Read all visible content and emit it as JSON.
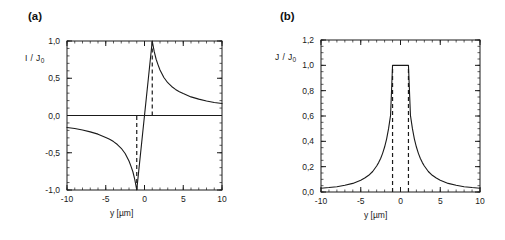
{
  "figure": {
    "width": 505,
    "height": 240,
    "background": "#ffffff",
    "line_color": "#1a1a1a"
  },
  "panels": [
    {
      "label": "(a)",
      "name": "panel-a",
      "ylabel_main": "I / J",
      "ylabel_sub": "0",
      "xlabel": "y [µm]"
    },
    {
      "label": "(b)",
      "name": "panel-b",
      "ylabel_main": "J / J",
      "ylabel_sub": "0",
      "xlabel": "y [µm]"
    }
  ],
  "chart_data": [
    {
      "type": "line",
      "panel": "(a)",
      "title": "",
      "xlabel": "y [µm]",
      "ylabel": "I / J0",
      "xlim": [
        -10,
        10
      ],
      "ylim": [
        -1.0,
        1.0
      ],
      "xticks": [
        -10,
        -5,
        0,
        5,
        10
      ],
      "xticklabels": [
        "-10",
        "-5",
        "0",
        "5",
        "10"
      ],
      "yticks": [
        -1.0,
        -0.5,
        0.0,
        0.5,
        1.0
      ],
      "yticklabels": [
        "-1,0",
        "-0,5",
        "0,0",
        "0,5",
        "1,0"
      ],
      "minor_tick_step_x": 1,
      "minor_tick_step_y": 0.1,
      "grid": false,
      "legend": null,
      "annotations": [
        {
          "type": "vline",
          "x": -1,
          "style": "dashed",
          "y_from": -1.0,
          "y_to": 0.0
        },
        {
          "type": "vline",
          "x": 1,
          "style": "dashed",
          "y_from": 0.0,
          "y_to": 1.0
        },
        {
          "type": "hline",
          "y": 0.0,
          "style": "solid"
        }
      ],
      "series": [
        {
          "name": "I/J0",
          "description": "antisymmetric response; linear ramp from -1 to +1 across |y|<1, then 1/y decay",
          "x": [
            -10,
            -9,
            -8,
            -7,
            -6,
            -5,
            -4.5,
            -4,
            -3.5,
            -3,
            -2.5,
            -2,
            -1.75,
            -1.5,
            -1.25,
            -1.0,
            -0.75,
            -0.5,
            -0.25,
            0,
            0.25,
            0.5,
            0.75,
            1.0,
            1.25,
            1.5,
            1.75,
            2,
            2.5,
            3,
            3.5,
            4,
            4.5,
            5,
            6,
            7,
            8,
            9,
            10
          ],
          "values": [
            -0.16,
            -0.175,
            -0.195,
            -0.22,
            -0.25,
            -0.295,
            -0.32,
            -0.35,
            -0.39,
            -0.44,
            -0.51,
            -0.61,
            -0.68,
            -0.755,
            -0.86,
            -1.0,
            -0.75,
            -0.5,
            -0.25,
            0.0,
            0.25,
            0.5,
            0.75,
            1.0,
            0.86,
            0.755,
            0.68,
            0.61,
            0.51,
            0.44,
            0.39,
            0.35,
            0.32,
            0.295,
            0.25,
            0.22,
            0.195,
            0.175,
            0.16
          ]
        }
      ]
    },
    {
      "type": "line",
      "panel": "(b)",
      "title": "",
      "xlabel": "y [µm]",
      "ylabel": "J / J0",
      "xlim": [
        -10,
        10
      ],
      "ylim": [
        0.0,
        1.2
      ],
      "xticks": [
        -10,
        -5,
        0,
        5,
        10
      ],
      "xticklabels": [
        "-10",
        "-5",
        "0",
        "5",
        "10"
      ],
      "yticks": [
        0.0,
        0.2,
        0.4,
        0.6,
        0.8,
        1.0,
        1.2
      ],
      "yticklabels": [
        "0,0",
        "0,2",
        "0,4",
        "0,6",
        "0,8",
        "1,0",
        "1,2"
      ],
      "minor_tick_step_x": 1,
      "minor_tick_step_y": 0.05,
      "grid": false,
      "legend": null,
      "annotations": [
        {
          "type": "vline",
          "x": -1,
          "style": "dashed",
          "y_from": 0.0,
          "y_to": 1.0
        },
        {
          "type": "vline",
          "x": 1,
          "style": "dashed",
          "y_from": 0.0,
          "y_to": 1.0
        }
      ],
      "series": [
        {
          "name": "J/J0",
          "description": "symmetric; flat plateau at 1.0 for |y|<1, then ~1/y^2 decay to 0.03 at |y|=10",
          "x": [
            -10,
            -9,
            -8,
            -7,
            -6,
            -5,
            -4.5,
            -4,
            -3.5,
            -3,
            -2.75,
            -2.5,
            -2.25,
            -2,
            -1.75,
            -1.5,
            -1.25,
            -1.0,
            0,
            1.0,
            1.25,
            1.5,
            1.75,
            2,
            2.25,
            2.5,
            2.75,
            3,
            3.5,
            4,
            4.5,
            5,
            6,
            7,
            8,
            9,
            10
          ],
          "values": [
            0.03,
            0.035,
            0.042,
            0.053,
            0.068,
            0.093,
            0.11,
            0.132,
            0.162,
            0.205,
            0.232,
            0.265,
            0.305,
            0.355,
            0.418,
            0.5,
            0.605,
            1.0,
            1.0,
            1.0,
            0.605,
            0.5,
            0.418,
            0.355,
            0.305,
            0.265,
            0.232,
            0.205,
            0.162,
            0.132,
            0.11,
            0.093,
            0.068,
            0.053,
            0.042,
            0.035,
            0.03
          ]
        }
      ]
    }
  ]
}
